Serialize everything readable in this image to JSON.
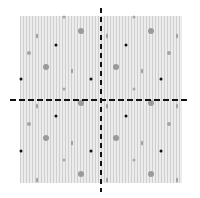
{
  "figure": {
    "colors": {
      "stripe_dark": "#cfcfcf",
      "stripe_light": "#ececec",
      "axis": "#111111",
      "dot_black": "#111111",
      "dot_gray": "#9a9a9a"
    }
  },
  "markers": [
    {
      "x": 64,
      "y": 17,
      "kind": "gray-sm"
    },
    {
      "x": 134,
      "y": 17,
      "kind": "gray-sm"
    },
    {
      "x": 81,
      "y": 31,
      "kind": "gray-lg"
    },
    {
      "x": 151,
      "y": 31,
      "kind": "gray-lg"
    },
    {
      "x": 37,
      "y": 36,
      "kind": "gray-el"
    },
    {
      "x": 107,
      "y": 36,
      "kind": "gray-el"
    },
    {
      "x": 177,
      "y": 36,
      "kind": "gray-el"
    },
    {
      "x": 56,
      "y": 45,
      "kind": "black"
    },
    {
      "x": 126,
      "y": 45,
      "kind": "black"
    },
    {
      "x": 29,
      "y": 53,
      "kind": "gray-md"
    },
    {
      "x": 169,
      "y": 53,
      "kind": "gray-md"
    },
    {
      "x": 46,
      "y": 67,
      "kind": "gray-lg"
    },
    {
      "x": 116,
      "y": 67,
      "kind": "gray-lg"
    },
    {
      "x": 72,
      "y": 71,
      "kind": "gray-el"
    },
    {
      "x": 142,
      "y": 71,
      "kind": "gray-el"
    },
    {
      "x": 21,
      "y": 79,
      "kind": "black"
    },
    {
      "x": 91,
      "y": 79,
      "kind": "black"
    },
    {
      "x": 161,
      "y": 79,
      "kind": "black"
    },
    {
      "x": 64,
      "y": 89,
      "kind": "gray-sm"
    },
    {
      "x": 134,
      "y": 89,
      "kind": "gray-sm"
    },
    {
      "x": 81,
      "y": 103,
      "kind": "gray-lg"
    },
    {
      "x": 151,
      "y": 103,
      "kind": "gray-lg"
    },
    {
      "x": 37,
      "y": 106,
      "kind": "gray-el"
    },
    {
      "x": 107,
      "y": 106,
      "kind": "gray-el"
    },
    {
      "x": 177,
      "y": 106,
      "kind": "gray-el"
    },
    {
      "x": 56,
      "y": 116,
      "kind": "black"
    },
    {
      "x": 126,
      "y": 116,
      "kind": "black"
    },
    {
      "x": 29,
      "y": 124,
      "kind": "gray-md"
    },
    {
      "x": 169,
      "y": 124,
      "kind": "gray-md"
    },
    {
      "x": 46,
      "y": 138,
      "kind": "gray-lg"
    },
    {
      "x": 116,
      "y": 138,
      "kind": "gray-lg"
    },
    {
      "x": 72,
      "y": 143,
      "kind": "gray-el"
    },
    {
      "x": 142,
      "y": 143,
      "kind": "gray-el"
    },
    {
      "x": 21,
      "y": 151,
      "kind": "black"
    },
    {
      "x": 91,
      "y": 151,
      "kind": "black"
    },
    {
      "x": 161,
      "y": 151,
      "kind": "black"
    },
    {
      "x": 64,
      "y": 160,
      "kind": "gray-sm"
    },
    {
      "x": 134,
      "y": 160,
      "kind": "gray-sm"
    },
    {
      "x": 81,
      "y": 174,
      "kind": "gray-lg"
    },
    {
      "x": 151,
      "y": 174,
      "kind": "gray-lg"
    },
    {
      "x": 37,
      "y": 180,
      "kind": "gray-el"
    },
    {
      "x": 107,
      "y": 180,
      "kind": "gray-el"
    },
    {
      "x": 177,
      "y": 180,
      "kind": "gray-el"
    }
  ]
}
